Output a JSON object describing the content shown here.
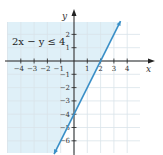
{
  "chart_data": {
    "type": "line",
    "title": "",
    "annotation": "2x − y ≤ 4",
    "xlabel": "x",
    "ylabel": "y",
    "xlim": [
      -5,
      5
    ],
    "ylim": [
      -7,
      3
    ],
    "grid": true,
    "x_ticks": [
      -4,
      -3,
      -2,
      -1,
      1,
      2,
      3,
      4
    ],
    "x_tick_labels": [
      "−4",
      "−3",
      "−2",
      "−1",
      "1",
      "2",
      "3",
      "4"
    ],
    "y_ticks": [
      2,
      1,
      -1,
      -2,
      -3,
      -4,
      -5,
      -6
    ],
    "y_tick_labels": [
      "2",
      "1",
      "−1",
      "−2",
      "−3",
      "−4",
      "−5",
      "−6"
    ],
    "series": [
      {
        "name": "2x − y = 4 (boundary, solid)",
        "equation": "y = 2x − 4",
        "x": [
          -1.5,
          0,
          2,
          3.5
        ],
        "y": [
          -7,
          -4,
          0,
          3
        ],
        "style": "solid"
      }
    ],
    "shaded_region": {
      "description": "half-plane left/above the line, satisfying 2x − y ≤ 4",
      "color": "#dff0f8"
    },
    "line_color": "#3a8fc7",
    "grid_color": "#d9e3ea",
    "axis_color": "#222222"
  }
}
